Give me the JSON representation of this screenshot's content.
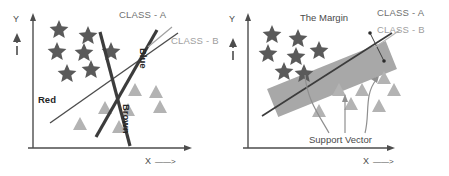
{
  "figure": {
    "background": "#ffffff",
    "colors": {
      "star": "#5a5a5a",
      "triangle": "#b3b3b3",
      "axis": "#4d4d4d",
      "boundary_line": "#3c3c3c",
      "margin_band": "#a8a8a8",
      "label_dark": "#262626",
      "label_gray_a": "#6f6f6f",
      "label_gray_b": "#9e9e9e",
      "pointer": "#8f8f8f"
    }
  },
  "left_panel": {
    "name": "non-optimal-separators-panel",
    "axes": {
      "y_label": "Y",
      "x_label": "X",
      "x_arrow": "——>",
      "y_arrow_glyph": "↑"
    },
    "labels": {
      "class_a": "CLASS - A",
      "class_b": "CLASS - B",
      "red_line": "Red",
      "blue_line": "Blue",
      "brown_line": "Brown"
    },
    "stars": [
      {
        "x": 59,
        "y": 28
      },
      {
        "x": 88,
        "y": 34
      },
      {
        "x": 57,
        "y": 50
      },
      {
        "x": 84,
        "y": 51
      },
      {
        "x": 111,
        "y": 50
      },
      {
        "x": 67,
        "y": 72
      },
      {
        "x": 91,
        "y": 68
      }
    ],
    "triangles": [
      {
        "x": 135,
        "y": 90
      },
      {
        "x": 156,
        "y": 92
      },
      {
        "x": 105,
        "y": 108
      },
      {
        "x": 128,
        "y": 110
      },
      {
        "x": 160,
        "y": 107
      },
      {
        "x": 80,
        "y": 124
      },
      {
        "x": 119,
        "y": 127
      }
    ],
    "lines": [
      {
        "name": "red",
        "x1": 50,
        "y1": 123,
        "x2": 178,
        "y2": 33
      },
      {
        "name": "blue",
        "x1": 96,
        "y1": 137,
        "x2": 157,
        "y2": 30
      },
      {
        "name": "brown",
        "x1": 100,
        "y1": 32,
        "x2": 130,
        "y2": 146
      }
    ]
  },
  "right_panel": {
    "name": "optimal-margin-panel",
    "axes": {
      "y_label": "Y",
      "x_label": "X",
      "x_arrow": "——>",
      "y_arrow_glyph": "↑"
    },
    "labels": {
      "class_a": "CLASS - A",
      "class_b": "CLASS - B",
      "margin": "The Margin",
      "support_vector": "Support Vector"
    },
    "stars": [
      {
        "x": 48,
        "y": 33
      },
      {
        "x": 74,
        "y": 37
      },
      {
        "x": 44,
        "y": 52
      },
      {
        "x": 72,
        "y": 55
      },
      {
        "x": 95,
        "y": 49
      },
      {
        "x": 60,
        "y": 70
      },
      {
        "x": 80,
        "y": 72
      }
    ],
    "triangles": [
      {
        "x": 160,
        "y": 78
      },
      {
        "x": 138,
        "y": 90
      },
      {
        "x": 170,
        "y": 90
      },
      {
        "x": 115,
        "y": 90
      },
      {
        "x": 127,
        "y": 104
      },
      {
        "x": 155,
        "y": 106
      },
      {
        "x": 95,
        "y": 111
      }
    ],
    "margin_band": {
      "angle_deg": -22,
      "width": 128,
      "height": 30,
      "cx": 108,
      "cy": 79
    },
    "hyperplane": {
      "x1": 38,
      "y1": 116,
      "x2": 168,
      "y2": 33
    }
  }
}
